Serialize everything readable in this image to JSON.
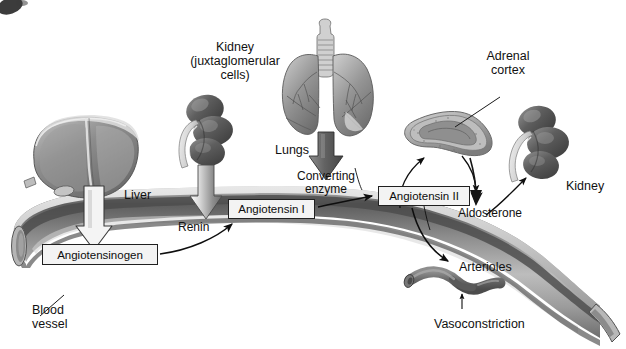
{
  "figure": {
    "corner_artifact": "scan-smudge"
  },
  "palette": {
    "vessel_rim_light": "#d6d6d6",
    "vessel_dark_band": "#4a4a4a",
    "vessel_mid": "#8a8a8a",
    "vessel_light": "#c9c9c9",
    "organ_dark": "#5c5c5c",
    "organ_mid": "#8f8f8f",
    "organ_light": "#d8d8d8",
    "arrow_gray": "#6f6f6f",
    "arrow_outline": "#303030",
    "text": "#111111",
    "box_fill": "#f3f3f3",
    "box_border": "#202020",
    "background": "#ffffff"
  },
  "boxed_labels": [
    {
      "name": "angiotensinogen",
      "text": "Angiotensinogen",
      "x": 42,
      "y": 244,
      "w": 116,
      "h": 21,
      "font_size": 11.5
    },
    {
      "name": "angiotensin-i",
      "text": "Angiotensin I",
      "x": 228,
      "y": 199,
      "w": 87,
      "h": 20,
      "font_size": 11.5
    },
    {
      "name": "angiotensin-ii",
      "text": "Angiotensin II",
      "x": 378,
      "y": 186,
      "w": 92,
      "h": 20,
      "font_size": 11.5
    }
  ],
  "plain_labels": [
    {
      "name": "kidney-juxtaglomerular",
      "lines": "Kidney\n(juxtaglomerular\ncells)",
      "x": 235,
      "y": 40,
      "font_size": 12.5,
      "align": "center"
    },
    {
      "name": "lungs",
      "lines": "Lungs",
      "x": 275,
      "y": 143,
      "font_size": 12.5,
      "align": "left"
    },
    {
      "name": "adrenal-cortex",
      "lines": "Adrenal\ncortex",
      "x": 508,
      "y": 49,
      "font_size": 12.5,
      "align": "center"
    },
    {
      "name": "liver",
      "lines": "Liver",
      "x": 124,
      "y": 188,
      "font_size": 12.5,
      "align": "left"
    },
    {
      "name": "converting-enzyme",
      "lines": "Converting\nenzyme",
      "x": 326,
      "y": 170,
      "font_size": 12,
      "align": "center"
    },
    {
      "name": "renin",
      "lines": "Renin",
      "x": 178,
      "y": 221,
      "font_size": 12,
      "align": "left"
    },
    {
      "name": "aldosterone",
      "lines": "Aldosterone",
      "x": 458,
      "y": 207,
      "font_size": 12,
      "align": "left"
    },
    {
      "name": "kidney-right",
      "lines": "Kidney",
      "x": 566,
      "y": 179,
      "font_size": 12.5,
      "align": "left"
    },
    {
      "name": "arterioles",
      "lines": "Arterioles",
      "x": 459,
      "y": 260,
      "font_size": 12.5,
      "align": "left"
    },
    {
      "name": "vasoconstriction",
      "lines": "Vasoconstriction",
      "x": 434,
      "y": 317,
      "font_size": 12.5,
      "align": "left"
    },
    {
      "name": "blood-vessel",
      "lines": "Blood\nvessel",
      "x": 32,
      "y": 303,
      "font_size": 12.5,
      "align": "left"
    }
  ],
  "organs": [
    {
      "name": "liver",
      "label": "Liver"
    },
    {
      "name": "kidney-juxtaglomerular",
      "label": "Kidney (juxtaglomerular cells)"
    },
    {
      "name": "lungs",
      "label": "Lungs"
    },
    {
      "name": "adrenal-gland",
      "label": "Adrenal cortex"
    },
    {
      "name": "kidney-right",
      "label": "Kidney"
    },
    {
      "name": "arteriole",
      "label": "Arterioles"
    },
    {
      "name": "blood-vessel",
      "label": "Blood vessel"
    }
  ],
  "flow_steps": [
    {
      "from": "Liver",
      "to": "Angiotensinogen",
      "arrow": "block-down-outlined"
    },
    {
      "from": "Kidney (juxtaglomerular cells)",
      "to": "Renin",
      "arrow": "block-down-gray"
    },
    {
      "from": "Angiotensinogen",
      "to": "Angiotensin I",
      "arrow": "curved-right"
    },
    {
      "from": "Lungs",
      "to": "Converting enzyme",
      "arrow": "block-down-dark"
    },
    {
      "from": "Angiotensin I",
      "to": "Angiotensin II",
      "arrow": "straight-right"
    },
    {
      "from": "Angiotensin II",
      "to": "Adrenal cortex",
      "arrow": "curved-up"
    },
    {
      "from": "Adrenal cortex",
      "to": "Aldosterone",
      "arrow": "curved-down"
    },
    {
      "from": "Aldosterone",
      "to": "Kidney",
      "arrow": "curved-up-right"
    },
    {
      "from": "Angiotensin II",
      "to": "Arterioles",
      "arrow": "curved-down-right"
    },
    {
      "from": "Arterioles",
      "to": "Vasoconstriction",
      "arrow": "up-thin"
    }
  ]
}
